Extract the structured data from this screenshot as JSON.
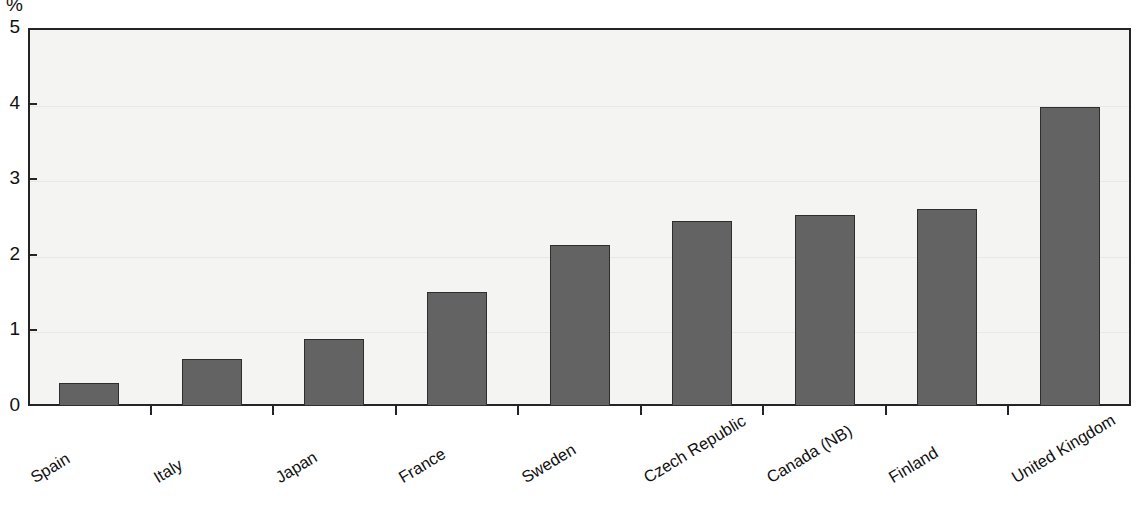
{
  "chart_data": {
    "type": "bar",
    "title": "",
    "subtitle": "",
    "xlabel": "",
    "ylabel": "%",
    "unit": "%",
    "ylim": [
      0,
      5
    ],
    "yticks": [
      0,
      1,
      2,
      3,
      4,
      5
    ],
    "ytick_labels": [
      "0",
      "1",
      "2",
      "3",
      "4",
      "5"
    ],
    "grid": true,
    "legend": null,
    "categories": [
      "Spain",
      "Italy",
      "Japan",
      "France",
      "Sweden",
      "Czech Republic",
      "Canada (NB)",
      "Finland",
      "United Kingdom"
    ],
    "values": [
      0.3,
      0.62,
      0.88,
      1.51,
      2.13,
      2.45,
      2.53,
      2.6,
      3.96
    ],
    "bar_color": "#636363",
    "bar_edge_color": "#2e2e2e",
    "plot_background": "#f4f4f2",
    "axis_color": "#242424",
    "label_rotation_deg": -31
  }
}
